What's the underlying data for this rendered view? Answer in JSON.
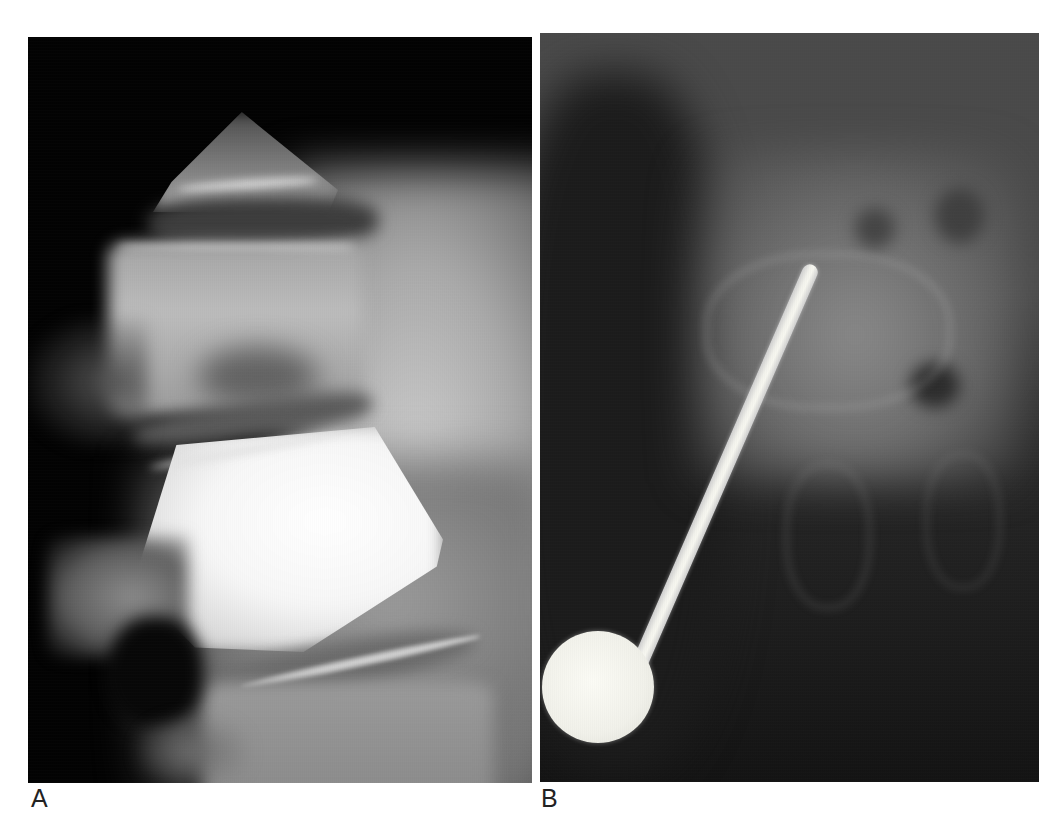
{
  "figure": {
    "panels": [
      {
        "id": "A",
        "label": "A",
        "description": "Lateral radiograph of lumbar spine showing vertebral bodies and intervertebral disc spaces, with a markedly dense (sclerotic) central vertebral body"
      },
      {
        "id": "B",
        "label": "B",
        "description": "Frontal radiograph of lumbar spine with a radiopaque pointer rod ending in a round ball marker positioned over a vertebra"
      }
    ]
  },
  "colors": {
    "background": "#ffffff",
    "label_text": "#222222",
    "radiograph_dark": "#030303",
    "radiograph_bright": "#f2f2f2",
    "marker": "#f0f0ea"
  }
}
